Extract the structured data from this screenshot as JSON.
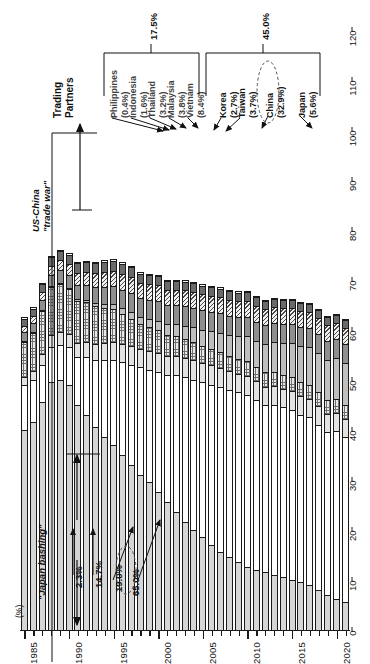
{
  "figure": {
    "unit_label": "(%)",
    "value_axis": {
      "label": "(%)",
      "min": 0,
      "max": 120,
      "step": 10,
      "ticks": [
        "0",
        "10",
        "20",
        "30",
        "40",
        "50",
        "60",
        "70",
        "80",
        "90",
        "100",
        "110",
        "120"
      ]
    },
    "category_axis": {
      "name": "year",
      "major_ticks": [
        "1985",
        "1990",
        "1995",
        "2000",
        "2005",
        "2010",
        "2015",
        "2020"
      ]
    }
  },
  "annotations": {
    "trading_partners": "Trading\nPartners",
    "trading_partners_line1": "Trading",
    "trading_partners_line2": "Partners",
    "trade_war_line1": "US-China",
    "trade_war_line2": "\"trade war\"",
    "japan_bashing": "\"Japan bashing\"",
    "bracket_asean_total": "17.5%",
    "bracket_ne_asia_total": "45.0%",
    "callouts": [
      {
        "text": "2.3%",
        "note": "circled-no"
      },
      {
        "text": "14.7%",
        "note": "circled-no"
      },
      {
        "text": "19.0%",
        "note": "circled-no"
      },
      {
        "text": "65.0%",
        "note": "circled-yes"
      }
    ]
  },
  "legend_callouts": [
    {
      "name": "Philippines",
      "share": "(0.4%)",
      "group": "ASEAN"
    },
    {
      "name": "Indonesia",
      "share": "(1.6%)",
      "group": "ASEAN"
    },
    {
      "name": "Thailand",
      "share": "(3.2%)",
      "group": "ASEAN"
    },
    {
      "name": "Malaysia",
      "share": "(3.8%)",
      "group": "ASEAN"
    },
    {
      "name": "Vietnam",
      "share": "(8.4%)",
      "group": "ASEAN"
    },
    {
      "name": "Korea",
      "share": "(2.7%)",
      "group": "NE-Asia"
    },
    {
      "name": "Taiwan",
      "share": "(3.7%)",
      "group": "NE-Asia"
    },
    {
      "name": "China",
      "share": "(32.9%)",
      "group": "NE-Asia"
    },
    {
      "name": "Japan",
      "share": "(5.6%)",
      "group": "NE-Asia"
    }
  ],
  "chart_data": {
    "type": "bar",
    "orientation": "horizontal-rotated",
    "stacked": true,
    "title": "",
    "xlabel": "",
    "ylabel": "(%)",
    "ylim": [
      0,
      120
    ],
    "grid": false,
    "legend_position": "callout-arrows-top",
    "categories": [
      "1985",
      "1986",
      "1987",
      "1988",
      "1989",
      "1990",
      "1991",
      "1992",
      "1993",
      "1994",
      "1995",
      "1996",
      "1997",
      "1998",
      "1999",
      "2000",
      "2001",
      "2002",
      "2003",
      "2004",
      "2005",
      "2006",
      "2007",
      "2008",
      "2009",
      "2010",
      "2011",
      "2012",
      "2013",
      "2014",
      "2015",
      "2016",
      "2017",
      "2018",
      "2019",
      "2020",
      "2021"
    ],
    "series": [
      {
        "name": "Japan",
        "color": "#d6d6d6",
        "pattern": "solid-light-gray",
        "values": [
          40.0,
          41.5,
          45.5,
          49.5,
          50.0,
          49.0,
          45.0,
          43.0,
          40.5,
          38.5,
          37.0,
          35.0,
          33.0,
          31.0,
          29.5,
          27.5,
          25.5,
          23.5,
          21.5,
          20.0,
          18.5,
          17.0,
          15.5,
          14.5,
          13.5,
          12.5,
          12.0,
          11.5,
          11.0,
          10.5,
          10.0,
          9.5,
          9.0,
          8.0,
          7.0,
          6.2,
          5.6
        ]
      },
      {
        "name": "China",
        "color": "#ffffff",
        "pattern": "white",
        "values": [
          9.0,
          8.5,
          7.5,
          7.0,
          7.0,
          7.5,
          9.5,
          11.5,
          13.5,
          15.5,
          17.0,
          18.5,
          20.0,
          21.5,
          22.5,
          24.0,
          25.5,
          27.5,
          29.0,
          30.0,
          31.0,
          32.0,
          33.0,
          33.5,
          34.0,
          34.5,
          34.0,
          33.5,
          34.0,
          34.0,
          34.0,
          33.5,
          33.5,
          33.0,
          32.5,
          33.5,
          32.9
        ]
      },
      {
        "name": "Taiwan",
        "color": "#e2e2e2",
        "pattern": "solid-pale-gray",
        "values": [
          1.5,
          1.8,
          2.2,
          2.5,
          2.6,
          2.6,
          2.8,
          3.0,
          3.2,
          3.4,
          3.6,
          3.6,
          3.7,
          3.6,
          3.7,
          3.8,
          3.7,
          3.8,
          3.9,
          4.0,
          3.9,
          3.9,
          3.8,
          3.7,
          3.7,
          3.8,
          3.7,
          3.6,
          3.7,
          3.7,
          3.7,
          3.7,
          3.7,
          3.7,
          3.7,
          3.7,
          3.7
        ]
      },
      {
        "name": "Korea",
        "color": "#e8e8e8",
        "pattern": "crosshatch-grid",
        "values": [
          7.0,
          7.5,
          8.5,
          9.5,
          9.5,
          9.0,
          8.5,
          8.0,
          7.5,
          7.0,
          6.5,
          6.0,
          5.5,
          5.0,
          4.8,
          4.6,
          4.3,
          4.0,
          3.8,
          3.6,
          3.4,
          3.3,
          3.2,
          3.1,
          3.0,
          3.0,
          2.9,
          2.9,
          2.8,
          2.8,
          2.8,
          2.8,
          2.8,
          2.8,
          2.7,
          2.7,
          2.7
        ]
      },
      {
        "name": "Vietnam",
        "color": "#bfbfbf",
        "pattern": "solid-mid-gray",
        "values": [
          0.2,
          0.2,
          0.2,
          0.2,
          0.3,
          0.3,
          0.4,
          0.5,
          0.6,
          0.8,
          1.0,
          1.2,
          1.4,
          1.5,
          1.7,
          1.9,
          2.1,
          2.3,
          2.6,
          2.9,
          3.2,
          3.5,
          3.9,
          4.2,
          4.5,
          4.9,
          5.2,
          5.6,
          6.0,
          6.4,
          6.8,
          7.2,
          7.6,
          7.9,
          8.1,
          8.3,
          8.4
        ]
      },
      {
        "name": "Malaysia",
        "color": "#8f8f8f",
        "pattern": "solid-dark-gray",
        "values": [
          1.8,
          1.9,
          2.1,
          2.3,
          2.5,
          2.6,
          2.8,
          3.0,
          3.2,
          3.4,
          3.6,
          3.7,
          3.8,
          3.7,
          3.8,
          3.9,
          3.8,
          3.8,
          3.9,
          3.9,
          3.9,
          3.9,
          3.9,
          3.8,
          3.8,
          3.9,
          3.8,
          3.8,
          3.8,
          3.8,
          3.8,
          3.8,
          3.8,
          3.8,
          3.8,
          3.8,
          3.8
        ]
      },
      {
        "name": "Thailand",
        "color": "#f0f0f0",
        "pattern": "diagonal-hatch",
        "values": [
          1.2,
          1.3,
          1.5,
          1.8,
          2.0,
          2.2,
          2.4,
          2.6,
          2.8,
          3.0,
          3.1,
          3.2,
          3.2,
          3.1,
          3.1,
          3.2,
          3.1,
          3.1,
          3.2,
          3.2,
          3.2,
          3.2,
          3.2,
          3.2,
          3.2,
          3.2,
          3.2,
          3.2,
          3.2,
          3.2,
          3.2,
          3.2,
          3.2,
          3.2,
          3.2,
          3.2,
          3.2
        ]
      },
      {
        "name": "Indonesia",
        "color": "#6a6a6a",
        "pattern": "solid-charcoal",
        "values": [
          1.5,
          1.5,
          1.6,
          1.7,
          1.8,
          1.8,
          1.9,
          1.9,
          2.0,
          2.0,
          2.0,
          2.0,
          1.9,
          1.8,
          1.8,
          1.8,
          1.7,
          1.7,
          1.7,
          1.7,
          1.7,
          1.7,
          1.7,
          1.7,
          1.7,
          1.7,
          1.7,
          1.7,
          1.6,
          1.6,
          1.6,
          1.6,
          1.6,
          1.6,
          1.6,
          1.6,
          1.6
        ]
      },
      {
        "name": "Philippines",
        "color": "#ffffff",
        "pattern": "white-narrow",
        "values": [
          0.5,
          0.5,
          0.5,
          0.5,
          0.5,
          0.5,
          0.5,
          0.5,
          0.5,
          0.5,
          0.5,
          0.5,
          0.5,
          0.5,
          0.5,
          0.5,
          0.5,
          0.5,
          0.5,
          0.5,
          0.5,
          0.5,
          0.5,
          0.5,
          0.5,
          0.4,
          0.4,
          0.4,
          0.4,
          0.4,
          0.4,
          0.4,
          0.4,
          0.4,
          0.4,
          0.4,
          0.4
        ]
      }
    ]
  }
}
